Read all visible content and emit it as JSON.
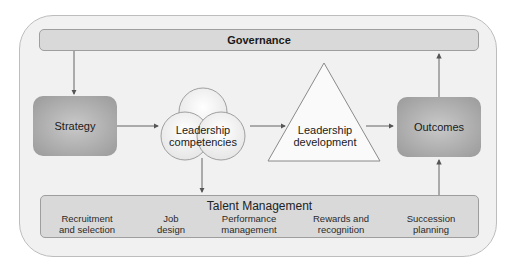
{
  "diagram": {
    "governance": {
      "label": "Governance"
    },
    "strategy": {
      "label": "Strategy"
    },
    "leadership_competencies": {
      "label": "Leadership\ncompetencies",
      "icon": "three-circles-cluster"
    },
    "leadership_development": {
      "label": "Leadership\ndevelopment",
      "icon": "triangle-pyramid"
    },
    "outcomes": {
      "label": "Outcomes"
    },
    "talent_management": {
      "title": "Talent Management",
      "items": [
        {
          "label": "Recruitment\nand selection"
        },
        {
          "label": "Job\ndesign"
        },
        {
          "label": "Performance\nmanagement"
        },
        {
          "label": "Rewards and\nrecognition"
        },
        {
          "label": "Succession\nplanning"
        }
      ]
    },
    "flows": [
      {
        "from": "Governance",
        "to": "Strategy"
      },
      {
        "from": "Strategy",
        "to": "Leadership competencies"
      },
      {
        "from": "Leadership competencies",
        "to": "Leadership development"
      },
      {
        "from": "Leadership competencies",
        "to": "Talent Management"
      },
      {
        "from": "Leadership development",
        "to": "Outcomes"
      },
      {
        "from": "Talent Management",
        "to": "Outcomes"
      },
      {
        "from": "Outcomes",
        "to": "Governance"
      }
    ],
    "colors": {
      "frame_bg": "#f1f1f1",
      "bar_bg": "#d9d9d9",
      "box_bg": "#a8a8a8",
      "line": "#555555"
    }
  }
}
